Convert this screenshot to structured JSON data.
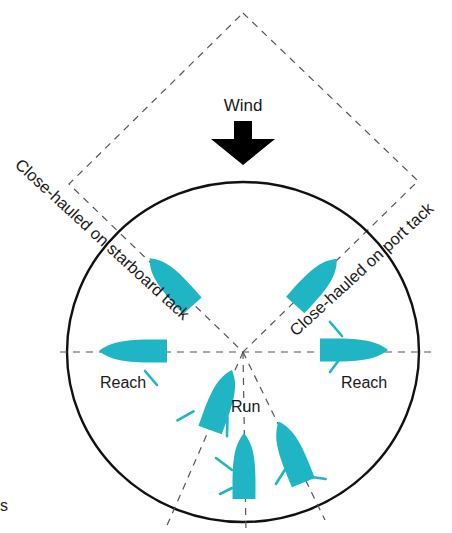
{
  "diagram": {
    "wind": {
      "label": "Wind",
      "arrow": "down-arrow",
      "x": 243,
      "label_y": 111,
      "arrow_top": 121,
      "arrow_bottom": 165
    },
    "labels": {
      "close_hauled_starboard": "Close-hauled on starboard tack",
      "close_hauled_port": "Close-hauled on port tack",
      "reach_left": "Reach",
      "reach_right": "Reach",
      "run": "Run"
    },
    "edge_text": "s",
    "colors": {
      "boat": "#1fb5c5",
      "circle": "#111111",
      "dash": "#555555",
      "text": "#1a1a1a"
    },
    "geometry": {
      "center": [
        243,
        352
      ],
      "circle_rx": 176,
      "circle_ry": 170,
      "no_go_diamond": [
        [
          243,
          13
        ],
        [
          418,
          181
        ],
        [
          243,
          352
        ],
        [
          69,
          184
        ]
      ],
      "axes": [
        {
          "name": "horizontal",
          "from": [
            60,
            352
          ],
          "to": [
            436,
            352
          ]
        },
        {
          "name": "run-left",
          "from": [
            243,
            352
          ],
          "to": [
            165,
            530
          ]
        },
        {
          "name": "run-center",
          "from": [
            243,
            352
          ],
          "to": [
            246,
            533
          ]
        },
        {
          "name": "run-right",
          "from": [
            243,
            352
          ],
          "to": [
            325,
            520
          ]
        }
      ]
    },
    "boats": [
      {
        "name": "boat-close-hauled-starboard",
        "cx": 171,
        "cy": 282,
        "angle": -42,
        "len": 64,
        "beam": 26,
        "sheets": []
      },
      {
        "name": "boat-close-hauled-port",
        "cx": 316,
        "cy": 282,
        "angle": 42,
        "len": 62,
        "beam": 26,
        "sheets": []
      },
      {
        "name": "boat-reach-left",
        "cx": 133,
        "cy": 351,
        "angle": -90,
        "len": 68,
        "beam": 24,
        "sheets": [
          [
            -4,
            12,
            10,
            22
          ],
          [
            -20,
            12,
            -34,
            24
          ]
        ]
      },
      {
        "name": "boat-reach-right",
        "cx": 354,
        "cy": 350,
        "angle": 90,
        "len": 68,
        "beam": 24,
        "sheets": [
          [
            6,
            12,
            22,
            24
          ],
          [
            -14,
            12,
            -28,
            24
          ]
        ]
      },
      {
        "name": "boat-run-left",
        "cx": 221,
        "cy": 400,
        "angle": 20,
        "len": 64,
        "beam": 26,
        "sheets": [
          [
            12,
            14,
            18,
            32
          ],
          [
            -22,
            20,
            -34,
            34
          ]
        ]
      },
      {
        "name": "boat-run-center",
        "cx": 244,
        "cy": 466,
        "angle": 0,
        "len": 66,
        "beam": 24,
        "sheets": [
          [
            -12,
            4,
            -28,
            -8
          ],
          [
            -12,
            22,
            -24,
            28
          ]
        ]
      },
      {
        "name": "boat-run-right",
        "cx": 291,
        "cy": 452,
        "angle": -22,
        "len": 66,
        "beam": 26,
        "sheets": [
          [
            -12,
            14,
            -26,
            24
          ],
          [
            8,
            30,
            22,
            38
          ]
        ]
      }
    ]
  }
}
